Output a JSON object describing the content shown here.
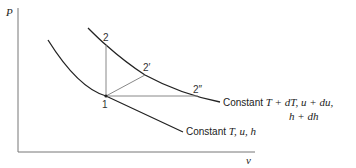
{
  "axes": {
    "y_label": "P",
    "x_label": "v"
  },
  "points": {
    "p1": "1",
    "p2": "2",
    "p2prime": "2′",
    "p2dprime": "2″"
  },
  "curves": {
    "upper": {
      "label_prefix": "Constant ",
      "label_math_line1": "T + dT,   u + du,",
      "label_math_line2": "h + dh"
    },
    "lower": {
      "label_prefix": "Constant ",
      "label_math": "T, u, h"
    }
  },
  "colors": {
    "curve": "#222222",
    "construction": "#888888",
    "axis": "#777777"
  }
}
